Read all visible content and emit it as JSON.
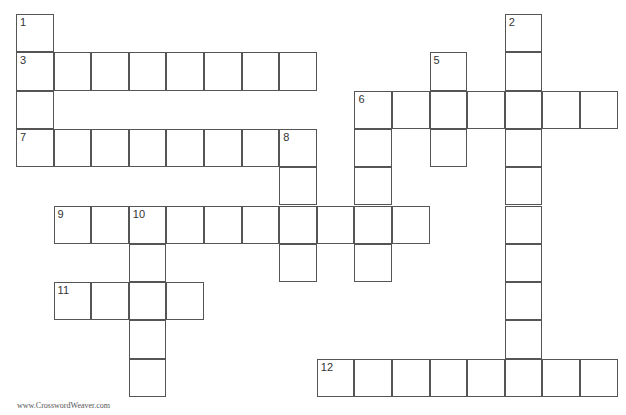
{
  "puzzle": {
    "cell_size": [
      37.6,
      38.3
    ],
    "origin": [
      16,
      14
    ],
    "entries": [
      {
        "number": 1,
        "direction": "down",
        "col": 0,
        "row": 0,
        "length": 4
      },
      {
        "number": 2,
        "direction": "down",
        "col": 13,
        "row": 0,
        "length": 10
      },
      {
        "number": 3,
        "direction": "across",
        "col": 0,
        "row": 1,
        "length": 8
      },
      {
        "number": 4,
        "direction": "down",
        "col": 9,
        "row": 2,
        "length": 5
      },
      {
        "number": 5,
        "direction": "down",
        "col": 11,
        "row": 1,
        "length": 3
      },
      {
        "number": 6,
        "direction": "across",
        "col": 9,
        "row": 2,
        "length": 7
      },
      {
        "number": 7,
        "direction": "across",
        "col": 0,
        "row": 3,
        "length": 8
      },
      {
        "number": 8,
        "direction": "down",
        "col": 7,
        "row": 3,
        "length": 4
      },
      {
        "number": 9,
        "direction": "across",
        "col": 1,
        "row": 5,
        "length": 10
      },
      {
        "number": 10,
        "direction": "down",
        "col": 3,
        "row": 5,
        "length": 5
      },
      {
        "number": 11,
        "direction": "across",
        "col": 1,
        "row": 7,
        "length": 4
      },
      {
        "number": 12,
        "direction": "across",
        "col": 8,
        "row": 9,
        "length": 8
      }
    ]
  },
  "footer": {
    "text": "www.CrosswordWeaver.com"
  }
}
